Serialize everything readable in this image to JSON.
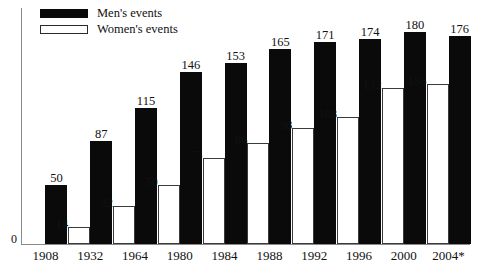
{
  "chart_data": {
    "type": "bar",
    "title": "",
    "subtitle": "",
    "xlabel": "",
    "ylabel": "",
    "ylim": [
      0,
      200
    ],
    "grid": false,
    "legend_position": "top-left",
    "origin_tick": "0",
    "categories": [
      "1908",
      "1932",
      "1964",
      "1980",
      "1984",
      "1988",
      "1992",
      "1996",
      "2000",
      "2004*"
    ],
    "series": [
      {
        "name": "Women's events",
        "color": "#ffffff",
        "border_color": "#3a3a3a",
        "values": [
          0,
          14,
          32,
          50,
          73,
          86,
          98,
          108,
          132,
          136
        ]
      },
      {
        "name": "Men's events",
        "color": "#0a0a0a",
        "border_color": "#0a0a0a",
        "values": [
          50,
          87,
          115,
          146,
          153,
          165,
          171,
          174,
          180,
          176
        ]
      }
    ],
    "annotations": [
      "2004* value is provisional as indicated by asterisk"
    ]
  },
  "legend": {
    "items": [
      {
        "label": "Men's events",
        "swatch": "filled-black-swatch"
      },
      {
        "label": "Women's events",
        "swatch": "outlined-white-swatch"
      }
    ]
  }
}
